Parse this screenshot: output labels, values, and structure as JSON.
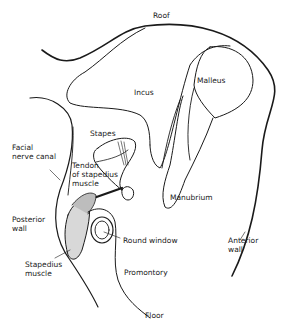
{
  "diagram": {
    "labels": {
      "roof": "Roof",
      "incus": "Incus",
      "malleus": "Malleus",
      "stapes": "Stapes",
      "facial_nerve_canal_1": "Facial",
      "facial_nerve_canal_2": "nerve canal",
      "tendon_1": "Tendon",
      "tendon_2": "of stapedius",
      "tendon_3": "muscle",
      "manubrium": "Manubrium",
      "posterior_wall_1": "Posterior",
      "posterior_wall_2": "wall",
      "round_window": "Round window",
      "anterior_wall_1": "Anterior",
      "anterior_wall_2": "wall",
      "stapedius_muscle_1": "Stapedius",
      "stapedius_muscle_2": "muscle",
      "promontory": "Promontory",
      "floor": "Floor"
    },
    "colors": {
      "ink": "#1a1a1a",
      "background": "#ffffff"
    }
  }
}
